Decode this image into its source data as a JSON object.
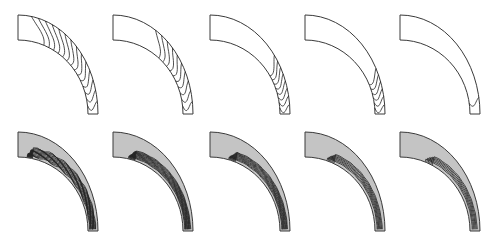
{
  "figure": {
    "colors": {
      "background": "#ffffff",
      "outline": "#3a3a3a",
      "contour": "#222222",
      "fill_top_row": "#ffffff",
      "fill_bottom_row": "#c4c4c4"
    },
    "rows": [
      {
        "name": "top-row",
        "shaded": false,
        "panels": [
          {
            "index": 1,
            "contour_count": 14,
            "extent": 0.95
          },
          {
            "index": 2,
            "contour_count": 10,
            "extent": 0.7
          },
          {
            "index": 3,
            "contour_count": 8,
            "extent": 0.45
          },
          {
            "index": 4,
            "contour_count": 6,
            "extent": 0.35
          },
          {
            "index": 5,
            "contour_count": 1,
            "extent": 0.2
          }
        ]
      },
      {
        "name": "bottom-row",
        "shaded": true,
        "panels": [
          {
            "index": 1,
            "contour_count": 14,
            "extent": 0.95
          },
          {
            "index": 2,
            "contour_count": 12,
            "extent": 0.85
          },
          {
            "index": 3,
            "contour_count": 10,
            "extent": 0.8
          },
          {
            "index": 4,
            "contour_count": 7,
            "extent": 0.75
          },
          {
            "index": 5,
            "contour_count": 6,
            "extent": 0.7
          }
        ]
      }
    ]
  }
}
